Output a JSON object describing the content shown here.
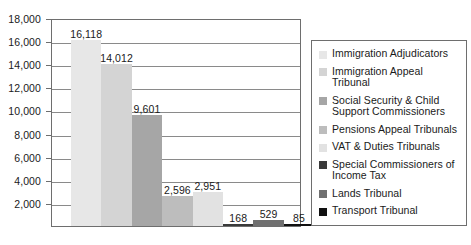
{
  "chart_data": {
    "type": "bar",
    "title": "",
    "subtitle": "",
    "xlabel": "",
    "ylabel": "",
    "ylim": [
      0,
      18000
    ],
    "grid": true,
    "legend_position": "right",
    "x_tick_labels": [],
    "y_tick_labels": [
      "18,000",
      "16,000",
      "14,000",
      "12,000",
      "10,000",
      "8,000",
      "6,000",
      "4,000",
      "2,000"
    ],
    "y_tick_values": [
      18000,
      16000,
      14000,
      12000,
      10000,
      8000,
      6000,
      4000,
      2000
    ],
    "categories": [
      "Immigration Adjudicators",
      "Immigration Appeal Tribunal",
      "Social Security & Child Support Commissioners",
      "Pensions Appeal Tribunals",
      "VAT & Duties Tribunals",
      "Special Commissioners of Income Tax",
      "Lands Tribunal",
      "Transport Tribunal"
    ],
    "values": [
      16118,
      14012,
      9601,
      2596,
      2951,
      168,
      529,
      85
    ],
    "value_labels": [
      "16,118",
      "14,012",
      "9,601",
      "2,596",
      "2,951",
      "168",
      "529",
      "85"
    ],
    "colors": [
      "#e7e7e7",
      "#d4d4d4",
      "#a6a6a6",
      "#bdbdbd",
      "#e2e2e2",
      "#3a3a3a",
      "#707070",
      "#101010"
    ]
  },
  "legend": {
    "items": [
      {
        "label": "Immigration Adjudicators",
        "color": "#e7e7e7"
      },
      {
        "label": "Immigration Appeal Tribunal",
        "color": "#d4d4d4"
      },
      {
        "label": "Social Security & Child Support Commissioners",
        "color": "#a6a6a6"
      },
      {
        "label": "Pensions Appeal Tribunals",
        "color": "#bdbdbd"
      },
      {
        "label": "VAT & Duties Tribunals",
        "color": "#e2e2e2"
      },
      {
        "label": "Special Commissioners of Income Tax",
        "color": "#3a3a3a"
      },
      {
        "label": "Lands Tribunal",
        "color": "#707070"
      },
      {
        "label": "Transport Tribunal",
        "color": "#101010"
      }
    ]
  }
}
